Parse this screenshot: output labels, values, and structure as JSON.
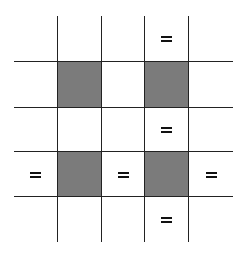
{
  "diagram": {
    "type": "grid",
    "rows": 5,
    "cols": 5,
    "colors": {
      "shaded": "#7b7b7b",
      "empty": "#ffffff",
      "line": "#222222",
      "symbol": "#111111"
    },
    "col_edges": [
      0,
      44,
      88,
      131,
      175,
      219
    ],
    "row_edges": [
      0,
      46,
      92,
      136,
      181,
      226
    ],
    "cells": [
      [
        "empty",
        "empty",
        "empty",
        "equals",
        "empty"
      ],
      [
        "empty",
        "shaded",
        "empty",
        "shaded",
        "empty"
      ],
      [
        "empty",
        "empty",
        "empty",
        "equals",
        "empty"
      ],
      [
        "equals",
        "shaded",
        "equals",
        "shaded",
        "equals"
      ],
      [
        "empty",
        "empty",
        "empty",
        "equals",
        "empty"
      ]
    ],
    "symbol_glyph": "="
  }
}
